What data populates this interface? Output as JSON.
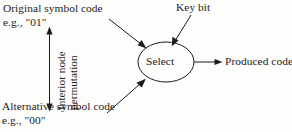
{
  "diagram": {
    "background_color": "#fdfdfc",
    "ink_color": "#1c1c1c",
    "labels": {
      "original_symbol_line1": "Original symbol code",
      "original_symbol_line2": "e.g., \"01\"",
      "alternative_symbol_line1": "Alternative symbol code",
      "alternative_symbol_line2": "e.g., \"00\"",
      "permutation_line1": "Interior node",
      "permutation_line2": "permutation",
      "key_bit": "Key bit",
      "produced_code": "Produced code",
      "select_node": "Select"
    },
    "nodes": [
      {
        "id": "select",
        "shape": "ellipse",
        "label": "Select",
        "cx": 166,
        "cy": 62,
        "rx": 28,
        "ry": 20
      }
    ],
    "connectors": [
      {
        "id": "original-to-select",
        "from": "original symbol code",
        "to": "select",
        "style": "arrow",
        "direction": "down-right"
      },
      {
        "id": "keybit-to-select",
        "from": "key bit",
        "to": "select",
        "style": "arrow",
        "direction": "down-left"
      },
      {
        "id": "alternative-to-select",
        "from": "alternative symbol code",
        "to": "select",
        "style": "arrow",
        "direction": "up-right"
      },
      {
        "id": "select-to-produced",
        "from": "select",
        "to": "produced code",
        "style": "arrow",
        "direction": "right"
      },
      {
        "id": "permutation-span",
        "from": "original symbol code",
        "to": "alternative symbol code",
        "style": "double-arrow",
        "direction": "vertical"
      }
    ]
  }
}
